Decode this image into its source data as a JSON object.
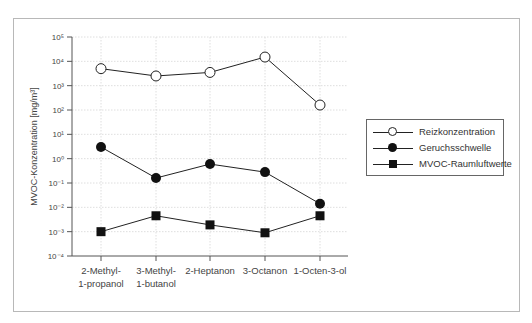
{
  "chart_data": {
    "type": "line",
    "title": "",
    "xlabel": "",
    "ylabel": "MVOC-Konzentration [mg/m³]",
    "yscale": "log",
    "ylim": [
      0.0001,
      100000
    ],
    "ytick_labels": [
      "10⁵",
      "10⁴",
      "10³",
      "10²",
      "10¹",
      "10⁰",
      "10⁻¹",
      "10⁻²",
      "10⁻³",
      "10⁻⁴"
    ],
    "categories": [
      [
        "2-Methyl-",
        "1-propanol"
      ],
      [
        "3-Methyl-",
        "1-butanol"
      ],
      [
        "2-Heptanon"
      ],
      [
        "3-Octanon"
      ],
      [
        "1-Octen-3-ol"
      ]
    ],
    "grid": true,
    "legend_position": "right",
    "series": [
      {
        "name": "Reizkonzentration",
        "marker": "open-circle",
        "values": [
          5000,
          2500,
          3500,
          15000,
          160
        ]
      },
      {
        "name": "Geruchsschwelle",
        "marker": "filled-circle",
        "values": [
          3,
          0.16,
          0.6,
          0.28,
          0.014
        ]
      },
      {
        "name": "MVOC-Raumluftwerte",
        "marker": "filled-square",
        "values": [
          0.001,
          0.0045,
          0.0019,
          0.0009,
          0.0045
        ]
      }
    ]
  },
  "legend": {
    "items": [
      {
        "label": "Reizkonzentration"
      },
      {
        "label": "Geruchsschwelle"
      },
      {
        "label": "MVOC-Raumluftwerte"
      }
    ]
  }
}
